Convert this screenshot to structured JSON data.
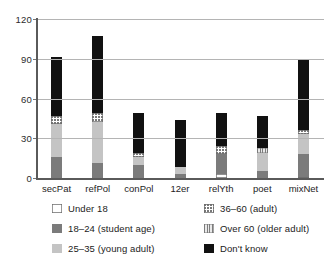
{
  "chart_data": {
    "type": "bar",
    "stacked": true,
    "title": "",
    "subtitle": "",
    "xlabel": "",
    "ylabel": "",
    "ylim": [
      0,
      120
    ],
    "yticks": [
      0,
      30,
      60,
      90,
      120
    ],
    "ytick_labels": [
      "0",
      "30",
      "60",
      "90",
      "120"
    ],
    "grid": true,
    "grid_axis": "y",
    "legend_position": "below-plot",
    "categories": [
      "secPat",
      "refPol",
      "conPol",
      "12er",
      "relYth",
      "poet",
      "mixNet"
    ],
    "series": [
      {
        "name": "Under 18",
        "color": "#ffffff",
        "pattern": "solid-outline",
        "values": [
          0,
          0,
          0,
          0,
          3,
          0,
          1
        ]
      },
      {
        "name": "18–24 (student age)",
        "color": "#7b7b7b",
        "pattern": "solid",
        "values": [
          16,
          11,
          10,
          3,
          15,
          5,
          17
        ]
      },
      {
        "name": "25–35 (young adult)",
        "color": "#c4c4c4",
        "pattern": "solid",
        "values": [
          25,
          31,
          6,
          5,
          0,
          14,
          15
        ]
      },
      {
        "name": "36–60 (adult)",
        "color": "#ffffff",
        "pattern": "dotted",
        "values": [
          6,
          7,
          3,
          0,
          6,
          0,
          3
        ]
      },
      {
        "name": "Over 60 (older adult)",
        "color": "#dcdcdc",
        "pattern": "vertical-hatch",
        "values": [
          0,
          0,
          0,
          0,
          0,
          4,
          0
        ]
      },
      {
        "name": "Don't know",
        "color": "#111111",
        "pattern": "solid",
        "values": [
          44,
          58,
          30,
          36,
          25,
          24,
          54
        ]
      }
    ],
    "totals": [
      91,
      107,
      49,
      44,
      49,
      47,
      90
    ]
  },
  "axis": {
    "y_tick_labels": [
      "120",
      "90",
      "60",
      "30",
      "0"
    ],
    "x_tick_labels": [
      "secPat",
      "refPol",
      "conPol",
      "12er",
      "relYth",
      "poet",
      "mixNet"
    ]
  },
  "legend": {
    "items": [
      {
        "label": "Under 18",
        "swatch": "swatch-under-18"
      },
      {
        "label": "36–60 (adult)",
        "swatch": "swatch-36-60"
      },
      {
        "label": "18–24 (student age)",
        "swatch": "swatch-18-24"
      },
      {
        "label": "Over 60 (older adult)",
        "swatch": "swatch-over-60"
      },
      {
        "label": "25–35 (young adult)",
        "swatch": "swatch-25-35"
      },
      {
        "label": "Don't know",
        "swatch": "swatch-dont-know"
      }
    ]
  },
  "colors": {
    "gridline": "#b4b4b4",
    "axis": "#5a5a5a",
    "text": "#1d1d1d",
    "background": "#ffffff"
  }
}
